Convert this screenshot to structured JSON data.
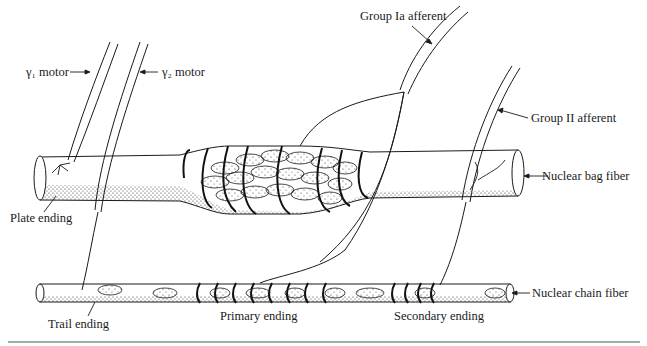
{
  "diagram": {
    "labels": {
      "gamma1_motor": "γ₁ motor",
      "gamma2_motor": "γ₂ motor",
      "group_ia_afferent": "Group Ia afferent",
      "group_ii_afferent": "Group II afferent",
      "nuclear_bag_fiber": "Nuclear bag fiber",
      "nuclear_chain_fiber": "Nuclear chain fiber",
      "plate_ending": "Plate ending",
      "trail_ending": "Trail ending",
      "primary_ending": "Primary ending",
      "secondary_ending": "Secondary ending"
    },
    "colors": {
      "ink": "#1a1a1a",
      "background": "#ffffff",
      "rule": "#555555"
    }
  }
}
